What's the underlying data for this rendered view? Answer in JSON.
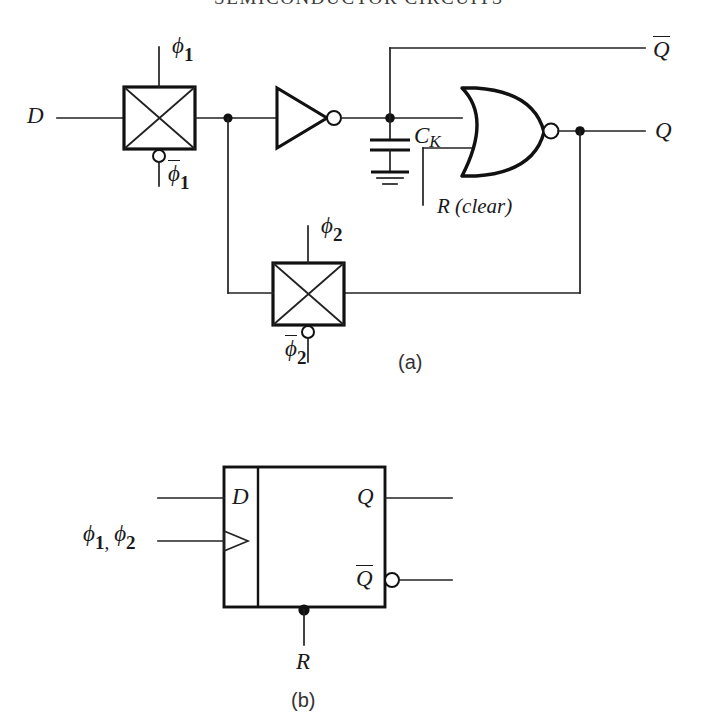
{
  "figure": {
    "running_head": "SEMICONDUCTOR CIRCUITS",
    "panel_a_caption": "(a)",
    "panel_b_caption": "(b)"
  },
  "panel_a": {
    "title": "Dynamic CMOS D flip-flop with clear",
    "input_label": "D",
    "clock_phase_1": "ϕ",
    "clock_phase_1_sub": "1",
    "clock_phase_1_bar": "ϕ",
    "clock_phase_1_bar_sub": "1",
    "clock_phase_2": "ϕ",
    "clock_phase_2_sub": "2",
    "clock_phase_2_bar": "ϕ",
    "clock_phase_2_bar_sub": "2",
    "storage_cap_label": "C",
    "storage_cap_sub": "K",
    "reset_label": "R (clear)",
    "output_q": "Q",
    "output_qbar": "Q",
    "elements": [
      "transmission-gate-1",
      "inverter",
      "storage-capacitor",
      "ground",
      "nor-gate",
      "transmission-gate-2"
    ]
  },
  "panel_b": {
    "title": "D flip-flop block symbol",
    "input_label": "D",
    "clock_label_phi1": "ϕ",
    "clock_label_phi1_sub": "1",
    "clock_label_comma": ",",
    "clock_label_phi2": "ϕ",
    "clock_label_phi2_sub": "2",
    "output_q": "Q",
    "output_qbar": "Q",
    "reset_label": "R"
  }
}
